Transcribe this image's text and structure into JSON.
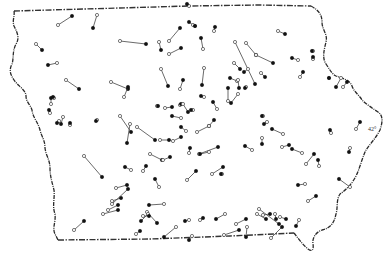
{
  "map": {
    "title": "",
    "region": "Iowa",
    "colors": {
      "ink": "#111111",
      "line": "#444444",
      "background": "#ffffff"
    },
    "latitude_label": "42°",
    "legend": {
      "open_circle": "start point",
      "filled_circle": "end point"
    },
    "segments": [
      {
        "from": [
          58,
          25
        ],
        "to": [
          72,
          16
        ]
      },
      {
        "from": [
          97,
          15
        ],
        "to": [
          93,
          28
        ]
      },
      {
        "from": [
          36,
          44
        ],
        "to": [
          42,
          50
        ]
      },
      {
        "from": [
          57,
          63
        ],
        "to": [
          48,
          65
        ]
      },
      {
        "from": [
          66,
          80
        ],
        "to": [
          79,
          89
        ]
      },
      {
        "from": [
          120,
          41
        ],
        "to": [
          146,
          44
        ]
      },
      {
        "from": [
          159,
          42
        ],
        "to": [
          161,
          50
        ]
      },
      {
        "from": [
          169,
          41
        ],
        "to": [
          180,
          28
        ]
      },
      {
        "from": [
          169,
          54
        ],
        "to": [
          181,
          48
        ]
      },
      {
        "from": [
          193,
          25
        ],
        "to": [
          189,
          22
        ]
      },
      {
        "from": [
          189,
          6
        ],
        "to": [
          187,
          4
        ]
      },
      {
        "from": [
          195,
          26
        ],
        "to": [
          195,
          26
        ]
      },
      {
        "from": [
          235,
          42
        ],
        "to": [
          255,
          84
        ]
      },
      {
        "from": [
          246,
          43
        ],
        "to": [
          256,
          55
        ]
      },
      {
        "from": [
          256,
          55
        ],
        "to": [
          273,
          63
        ]
      },
      {
        "from": [
          214,
          31
        ],
        "to": [
          215,
          27
        ]
      },
      {
        "from": [
          278,
          31
        ],
        "to": [
          285,
          34
        ]
      },
      {
        "from": [
          203,
          49
        ],
        "to": [
          201,
          38
        ]
      },
      {
        "from": [
          234,
          63
        ],
        "to": [
          240,
          69
        ]
      },
      {
        "from": [
          248,
          69
        ],
        "to": [
          244,
          72
        ]
      },
      {
        "from": [
          204,
          68
        ],
        "to": [
          202,
          85
        ]
      },
      {
        "from": [
          237,
          81
        ],
        "to": [
          230,
          78
        ]
      },
      {
        "from": [
          261,
          73
        ],
        "to": [
          265,
          77
        ]
      },
      {
        "from": [
          246,
          87
        ],
        "to": [
          245,
          88
        ]
      },
      {
        "from": [
          238,
          80
        ],
        "to": [
          239,
          88
        ]
      },
      {
        "from": [
          298,
          60
        ],
        "to": [
          292,
          58
        ]
      },
      {
        "from": [
          300,
          77
        ],
        "to": [
          303,
          72
        ]
      },
      {
        "from": [
          313,
          51
        ],
        "to": [
          312,
          51
        ]
      },
      {
        "from": [
          313,
          59
        ],
        "to": [
          313,
          57
        ]
      },
      {
        "from": [
          329,
          78
        ],
        "to": [
          329,
          78
        ]
      },
      {
        "from": [
          341,
          78
        ],
        "to": [
          336,
          87
        ]
      },
      {
        "from": [
          343,
          87
        ],
        "to": [
          347,
          82
        ]
      },
      {
        "from": [
          161,
          69
        ],
        "to": [
          168,
          86
        ]
      },
      {
        "from": [
          180,
          89
        ],
        "to": [
          183,
          80
        ]
      },
      {
        "from": [
          204,
          97
        ],
        "to": [
          201,
          96
        ]
      },
      {
        "from": [
          111,
          82
        ],
        "to": [
          128,
          89
        ]
      },
      {
        "from": [
          124,
          97
        ],
        "to": [
          128,
          87
        ]
      },
      {
        "from": [
          51,
          104
        ],
        "to": [
          51,
          98
        ]
      },
      {
        "from": [
          50,
          113
        ],
        "to": [
          49,
          110
        ]
      },
      {
        "from": [
          54,
          98
        ],
        "to": [
          53,
          97
        ]
      },
      {
        "from": [
          59,
          121
        ],
        "to": [
          57,
          123
        ]
      },
      {
        "from": [
          63,
          117
        ],
        "to": [
          61,
          124
        ]
      },
      {
        "from": [
          70,
          125
        ],
        "to": [
          70,
          123
        ]
      },
      {
        "from": [
          97,
          120
        ],
        "to": [
          96,
          121
        ]
      },
      {
        "from": [
          130,
          124
        ],
        "to": [
          127,
          143
        ]
      },
      {
        "from": [
          137,
          127
        ],
        "to": [
          155,
          140
        ]
      },
      {
        "from": [
          120,
          116
        ],
        "to": [
          131,
          132
        ]
      },
      {
        "from": [
          180,
          105
        ],
        "to": [
          181,
          104
        ]
      },
      {
        "from": [
          183,
          104
        ],
        "to": [
          188,
          112
        ]
      },
      {
        "from": [
          193,
          110
        ],
        "to": [
          191,
          110
        ]
      },
      {
        "from": [
          217,
          109
        ],
        "to": [
          213,
          102
        ]
      },
      {
        "from": [
          157,
          106
        ],
        "to": [
          158,
          106
        ]
      },
      {
        "from": [
          165,
          108
        ],
        "to": [
          172,
          107
        ]
      },
      {
        "from": [
          181,
          118
        ],
        "to": [
          172,
          116
        ]
      },
      {
        "from": [
          186,
          131
        ],
        "to": [
          181,
          127
        ]
      },
      {
        "from": [
          197,
          132
        ],
        "to": [
          209,
          126
        ]
      },
      {
        "from": [
          209,
          126
        ],
        "to": [
          214,
          120
        ]
      },
      {
        "from": [
          228,
          101
        ],
        "to": [
          228,
          88
        ]
      },
      {
        "from": [
          238,
          94
        ],
        "to": [
          231,
          103
        ]
      },
      {
        "from": [
          263,
          116
        ],
        "to": [
          262,
          116
        ]
      },
      {
        "from": [
          267,
          122
        ],
        "to": [
          264,
          124
        ]
      },
      {
        "from": [
          283,
          134
        ],
        "to": [
          272,
          129
        ]
      },
      {
        "from": [
          331,
          133
        ],
        "to": [
          330,
          130
        ]
      },
      {
        "from": [
          356,
          129
        ],
        "to": [
          360,
          122
        ]
      },
      {
        "from": [
          350,
          148
        ],
        "to": [
          349,
          152
        ]
      },
      {
        "from": [
          199,
          154
        ],
        "to": [
          218,
          147
        ]
      },
      {
        "from": [
          209,
          152
        ],
        "to": [
          200,
          154
        ]
      },
      {
        "from": [
          173,
          141
        ],
        "to": [
          181,
          137
        ]
      },
      {
        "from": [
          160,
          140
        ],
        "to": [
          169,
          140
        ]
      },
      {
        "from": [
          150,
          154
        ],
        "to": [
          162,
          160
        ]
      },
      {
        "from": [
          143,
          171
        ],
        "to": [
          146,
          166
        ]
      },
      {
        "from": [
          163,
          160
        ],
        "to": [
          170,
          157
        ]
      },
      {
        "from": [
          189,
          153
        ],
        "to": [
          190,
          148
        ]
      },
      {
        "from": [
          187,
          180
        ],
        "to": [
          196,
          171
        ]
      },
      {
        "from": [
          212,
          174
        ],
        "to": [
          223,
          167
        ]
      },
      {
        "from": [
          222,
          174
        ],
        "to": [
          221,
          174
        ]
      },
      {
        "from": [
          131,
          170
        ],
        "to": [
          125,
          167
        ]
      },
      {
        "from": [
          159,
          187
        ],
        "to": [
          155,
          179
        ]
      },
      {
        "from": [
          252,
          150
        ],
        "to": [
          245,
          146
        ]
      },
      {
        "from": [
          262,
          138
        ],
        "to": [
          262,
          144
        ]
      },
      {
        "from": [
          306,
          164
        ],
        "to": [
          314,
          154
        ]
      },
      {
        "from": [
          319,
          166
        ],
        "to": [
          318,
          160
        ]
      },
      {
        "from": [
          305,
          184
        ],
        "to": [
          298,
          185
        ]
      },
      {
        "from": [
          282,
          147
        ],
        "to": [
          289,
          145
        ]
      },
      {
        "from": [
          302,
          153
        ],
        "to": [
          292,
          149
        ]
      },
      {
        "from": [
          350,
          187
        ],
        "to": [
          339,
          179
        ]
      },
      {
        "from": [
          84,
          156
        ],
        "to": [
          102,
          177
        ]
      },
      {
        "from": [
          116,
          188
        ],
        "to": [
          127,
          185
        ]
      },
      {
        "from": [
          108,
          210
        ],
        "to": [
          118,
          205
        ]
      },
      {
        "from": [
          112,
          201
        ],
        "to": [
          121,
          198
        ]
      },
      {
        "from": [
          74,
          230
        ],
        "to": [
          84,
          221
        ]
      },
      {
        "from": [
          103,
          214
        ],
        "to": [
          118,
          210
        ]
      },
      {
        "from": [
          112,
          204
        ],
        "to": [
          128,
          189
        ]
      },
      {
        "from": [
          164,
          204
        ],
        "to": [
          149,
          205
        ]
      },
      {
        "from": [
          147,
          212
        ],
        "to": [
          157,
          223
        ]
      },
      {
        "from": [
          148,
          214
        ],
        "to": [
          141,
          221
        ]
      },
      {
        "from": [
          143,
          216
        ],
        "to": [
          149,
          216
        ]
      },
      {
        "from": [
          136,
          234
        ],
        "to": [
          140,
          231
        ]
      },
      {
        "from": [
          176,
          227
        ],
        "to": [
          164,
          237
        ]
      },
      {
        "from": [
          189,
          220
        ],
        "to": [
          185,
          221
        ]
      },
      {
        "from": [
          200,
          220
        ],
        "to": [
          203,
          218
        ]
      },
      {
        "from": [
          225,
          214
        ],
        "to": [
          216,
          219
        ]
      },
      {
        "from": [
          236,
          224
        ],
        "to": [
          246,
          219
        ]
      },
      {
        "from": [
          247,
          227
        ],
        "to": [
          246,
          237
        ]
      },
      {
        "from": [
          259,
          209
        ],
        "to": [
          279,
          224
        ]
      },
      {
        "from": [
          257,
          214
        ],
        "to": [
          266,
          219
        ]
      },
      {
        "from": [
          275,
          214
        ],
        "to": [
          276,
          219
        ]
      },
      {
        "from": [
          263,
          215
        ],
        "to": [
          270,
          214
        ]
      },
      {
        "from": [
          280,
          217
        ],
        "to": [
          286,
          219
        ]
      },
      {
        "from": [
          299,
          220
        ],
        "to": [
          296,
          226
        ]
      },
      {
        "from": [
          224,
          235
        ],
        "to": [
          239,
          230
        ]
      },
      {
        "from": [
          271,
          238
        ],
        "to": [
          282,
          227
        ]
      },
      {
        "from": [
          308,
          201
        ],
        "to": [
          316,
          196
        ]
      },
      {
        "from": [
          192,
          236
        ],
        "to": [
          189,
          240
        ]
      }
    ]
  }
}
